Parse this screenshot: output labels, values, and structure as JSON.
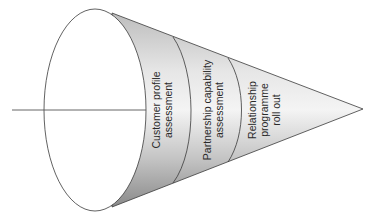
{
  "diagram": {
    "type": "cone-funnel",
    "orientation": "left-to-right, apex pointing right",
    "stages": [
      {
        "id": "stage-1",
        "lines": [
          "Customer profile",
          "assessment"
        ]
      },
      {
        "id": "stage-2",
        "lines": [
          "Partnership capability",
          "assessment"
        ]
      },
      {
        "id": "stage-3",
        "lines": [
          "Relationship",
          "programme",
          "roll out"
        ]
      }
    ],
    "colors": {
      "cone_light": "#f2f2f2",
      "cone_mid": "#c8c8c8",
      "cone_dark": "#8e8e8e",
      "outline": "#3a3a3a",
      "ellipse_fill": "#ffffff"
    }
  }
}
